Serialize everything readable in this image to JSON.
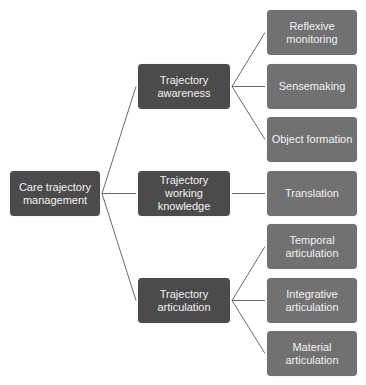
{
  "diagram": {
    "type": "tree",
    "colors": {
      "level1": "#4b4b4b",
      "level2": "#4b4b4b",
      "leaf": "#717171",
      "connector": "#6a6a6a",
      "text": "#f2f2f2"
    },
    "root": {
      "id": "root",
      "label": "Care trajectory management"
    },
    "branches": [
      {
        "id": "m1",
        "label": "Trajectory awareness",
        "children": [
          {
            "id": "l1",
            "label": "Reflexive monitoring"
          },
          {
            "id": "l2",
            "label": "Sensemaking"
          },
          {
            "id": "l3",
            "label": "Object formation"
          }
        ]
      },
      {
        "id": "m2",
        "label": "Trajectory working knowledge",
        "children": [
          {
            "id": "l4",
            "label": "Translation"
          }
        ]
      },
      {
        "id": "m3",
        "label": "Trajectory articulation",
        "children": [
          {
            "id": "l5",
            "label": "Temporal articulation"
          },
          {
            "id": "l6",
            "label": "Integrative articulation"
          },
          {
            "id": "l7",
            "label": "Material articulation"
          }
        ]
      }
    ]
  }
}
